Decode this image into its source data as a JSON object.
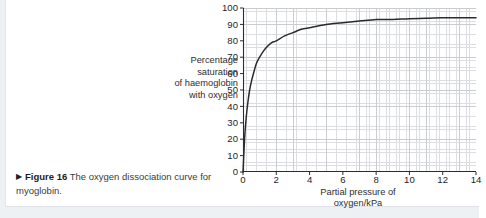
{
  "caption": {
    "arrow": "▶",
    "figure_number": "Figure 16",
    "text": "The oxygen dissociation curve for myoglobin."
  },
  "chart_data": {
    "type": "line",
    "title": "",
    "xlabel": "Partial pressure of oxygen/kPa",
    "ylabel": "Percentage saturation of haemoglobin with oxygen",
    "ylabel_lines": [
      "Percentage",
      "saturation",
      "of haemoglobin",
      "with oxygen"
    ],
    "xlabel_lines": [
      "Partial pressure of",
      "oxygen/kPa"
    ],
    "xlim": [
      0,
      14
    ],
    "ylim": [
      0,
      100
    ],
    "xticks": [
      0,
      2,
      4,
      6,
      8,
      10,
      12,
      14
    ],
    "yticks": [
      0,
      10,
      20,
      30,
      40,
      50,
      60,
      70,
      80,
      90,
      100
    ],
    "x_major_step": 2,
    "y_major_step": 10,
    "x_minor_per_major": 5,
    "y_minor_per_major": 5,
    "grid": true,
    "legend": false,
    "curve_color": "#2b2b2b",
    "grid_major_color": "#c9ccd1",
    "grid_minor_color": "#dcdee2",
    "axis_color": "#2b2b2b",
    "series": [
      {
        "name": "myoglobin",
        "model": "hyperbolic",
        "p50": 0.35,
        "plateau": 94,
        "x": [
          0,
          0.1,
          0.2,
          0.3,
          0.4,
          0.5,
          0.6,
          0.8,
          1.0,
          1.25,
          1.5,
          1.75,
          2.0,
          2.5,
          3.0,
          3.5,
          4.0,
          4.5,
          5.0,
          6.0,
          7.0,
          8.0,
          9.0,
          10.0,
          11.0,
          12.0,
          13.0,
          14.0
        ],
        "y": [
          0,
          21,
          34,
          43,
          50,
          55,
          59,
          66,
          70,
          74,
          77,
          79,
          80,
          83,
          85,
          87,
          88,
          89,
          90,
          91,
          92,
          93,
          93,
          93.5,
          93.7,
          94,
          94,
          94
        ]
      }
    ]
  }
}
